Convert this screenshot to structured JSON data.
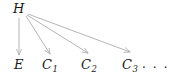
{
  "diagram": {
    "type": "directed-acyclic-graph",
    "background_color": "#ffffff",
    "edge_color": "#a8a8a8",
    "text_color": "#1a1a1a",
    "nodes": [
      {
        "id": "H",
        "label": "H",
        "subscript": "",
        "x": 19,
        "y": 9,
        "role": "latent-cause"
      },
      {
        "id": "E",
        "label": "E",
        "subscript": "",
        "x": 19,
        "y": 66,
        "role": "effect"
      },
      {
        "id": "C1",
        "label": "C",
        "subscript": "1",
        "x": 48,
        "y": 66,
        "role": "cause"
      },
      {
        "id": "C2",
        "label": "C",
        "subscript": "2",
        "x": 87,
        "y": 66,
        "role": "cause"
      },
      {
        "id": "C3",
        "label": "C",
        "subscript": "3",
        "x": 129,
        "y": 66,
        "role": "cause"
      }
    ],
    "ellipsis": {
      "text": "· · ·",
      "x": 149,
      "y": 68
    },
    "edges": [
      {
        "from": "H",
        "to": "E",
        "x1": 19,
        "y1": 18,
        "x2": 19,
        "y2": 55
      },
      {
        "from": "H",
        "to": "C1",
        "x1": 26,
        "y1": 16,
        "x2": 50,
        "y2": 54
      },
      {
        "from": "H",
        "to": "C2",
        "x1": 27,
        "y1": 15,
        "x2": 88,
        "y2": 53
      },
      {
        "from": "H",
        "to": "C3",
        "x1": 28,
        "y1": 14,
        "x2": 130,
        "y2": 52
      }
    ]
  }
}
